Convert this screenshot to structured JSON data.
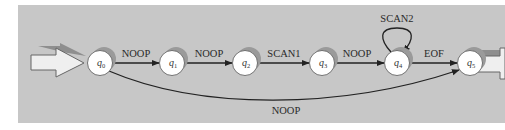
{
  "diagram": {
    "type": "finite-state-machine",
    "colors": {
      "panel": "#c7c7c7",
      "node_fill": "#ffffff",
      "node_shadow": "#9a9a9a",
      "edge": "#222222",
      "arrow_fill": "#efefef"
    },
    "states": [
      {
        "id": "q0",
        "base": "q",
        "sub": "0"
      },
      {
        "id": "q1",
        "base": "q",
        "sub": "1"
      },
      {
        "id": "q2",
        "base": "q",
        "sub": "2"
      },
      {
        "id": "q3",
        "base": "q",
        "sub": "3"
      },
      {
        "id": "q4",
        "base": "q",
        "sub": "4"
      },
      {
        "id": "q5",
        "base": "q",
        "sub": "5"
      }
    ],
    "transitions": [
      {
        "from": "q0",
        "to": "q1",
        "label": "NOOP"
      },
      {
        "from": "q1",
        "to": "q2",
        "label": "NOOP"
      },
      {
        "from": "q2",
        "to": "q3",
        "label": "SCAN1"
      },
      {
        "from": "q3",
        "to": "q4",
        "label": "NOOP"
      },
      {
        "from": "q4",
        "to": "q4",
        "label": "SCAN2"
      },
      {
        "from": "q4",
        "to": "q5",
        "label": "EOF"
      },
      {
        "from": "q0",
        "to": "q5",
        "label": "NOOP"
      }
    ],
    "start_state": "q0",
    "end_state": "q5"
  }
}
